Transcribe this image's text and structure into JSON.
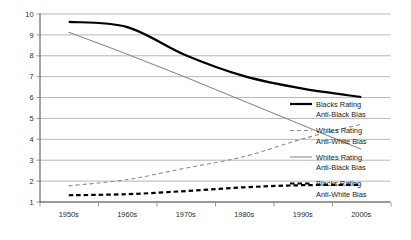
{
  "chart_data": {
    "type": "line",
    "title": "",
    "xlabel": "",
    "ylabel": "",
    "categories": [
      "1950s",
      "1960s",
      "1970s",
      "1980s",
      "1990s",
      "2000s"
    ],
    "ylim": [
      1,
      10
    ],
    "yticks": [
      "1",
      "2",
      "3",
      "4",
      "5",
      "6",
      "7",
      "8",
      "9",
      "10"
    ],
    "grid": "horizontal",
    "legend_position": "right",
    "series": [
      {
        "name": "Blacks Rating Anti-Black Bias",
        "label_line1": "Blacks Rating",
        "label_line2": "Anti-Black Bias",
        "style": "solid",
        "color": "#000000",
        "width": 2.2,
        "values": [
          9.6,
          9.35,
          8.0,
          7.0,
          6.4,
          6.0
        ]
      },
      {
        "name": "Whites Rating Anti-White Bias",
        "label_line1": "Whites Rating",
        "label_line2": "Anti-White Bias",
        "style": "dashed",
        "color": "#8c8c8c",
        "width": 1.1,
        "values": [
          1.75,
          2.05,
          2.6,
          3.15,
          4.0,
          4.7
        ]
      },
      {
        "name": "Whites Rating Anti-Black Bias",
        "label_line1": "Whites Rating",
        "label_line2": "Anti-Black Bias",
        "style": "solid",
        "color": "#8c8c8c",
        "width": 1.1,
        "values": [
          9.1,
          8.05,
          6.95,
          5.8,
          4.65,
          3.5
        ]
      },
      {
        "name": "Blacks Rating Anti-White Bias",
        "label_line1": "Blacks Rating",
        "label_line2": "Anti-White Bias",
        "style": "dashed",
        "color": "#000000",
        "width": 2.2,
        "values": [
          1.3,
          1.35,
          1.5,
          1.68,
          1.78,
          1.8
        ]
      }
    ]
  },
  "axis": {
    "y_labels": [
      "10",
      "9",
      "8",
      "7",
      "6",
      "5",
      "4",
      "3",
      "2",
      "1"
    ],
    "x_labels": [
      "1950s",
      "1960s",
      "1970s",
      "1980s",
      "1990s",
      "2000s"
    ]
  },
  "legend": {
    "entries": [
      {
        "line1": "Blacks Rating",
        "line2": "Anti-Black Bias"
      },
      {
        "line1": "Whites Rating",
        "line2": "Anti-White Bias"
      },
      {
        "line1": "Whites Rating",
        "line2": "Anti-Black Bias"
      },
      {
        "line1": "Blacks Rating",
        "line2": "Anti-White Bias"
      }
    ]
  },
  "colors": {
    "grid": "#a6a6a6",
    "axis": "#808080",
    "dark_series": "#000000",
    "light_series": "#8c8c8c",
    "background": "#ffffff",
    "text": "#2b2b2b"
  }
}
